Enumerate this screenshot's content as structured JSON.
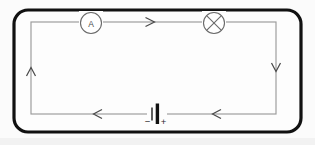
{
  "diagram": {
    "background_color": "#fbfbfb",
    "frame": {
      "name": "outer-rounded-frame",
      "stroke_color": "#111111",
      "fill_color": "#fdfdfd",
      "x": 14,
      "y": 10,
      "width": 287,
      "height": 122,
      "corner_radius": 14,
      "stroke_width": 3.2
    },
    "loop": {
      "name": "circuit-wire-loop",
      "stroke_color": "#9a9a9a",
      "left": 31,
      "top": 22,
      "right": 276,
      "bottom": 114
    },
    "components": [
      {
        "id": "ammeter",
        "label": "A",
        "symbol": "circle-letter",
        "description": "ammeter",
        "cx": 91,
        "cy": 23,
        "r": 10.5
      },
      {
        "id": "lamp",
        "label": "",
        "symbol": "circle-cross",
        "description": "lamp",
        "cx": 214,
        "cy": 23,
        "r": 10.5
      },
      {
        "id": "battery",
        "label": "",
        "symbol": "cell",
        "description": "battery cell",
        "cx": 156,
        "cy": 114,
        "negative_label": "−",
        "positive_label": "+"
      }
    ],
    "current_arrows": [
      {
        "id": "arrow-top",
        "direction": "right",
        "x": 153,
        "y": 22
      },
      {
        "id": "arrow-right",
        "direction": "down",
        "x": 276,
        "y": 69
      },
      {
        "id": "arrow-bottom-right",
        "direction": "left",
        "x": 214,
        "y": 114
      },
      {
        "id": "arrow-bottom-left",
        "direction": "left",
        "x": 95,
        "y": 114
      },
      {
        "id": "arrow-left",
        "direction": "up",
        "x": 31,
        "y": 70
      }
    ]
  }
}
